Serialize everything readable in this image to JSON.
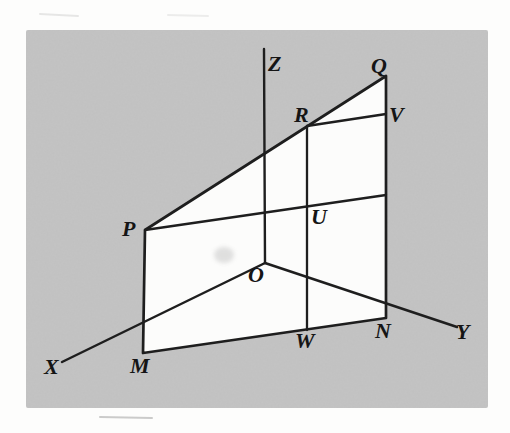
{
  "figure": {
    "colors": {
      "page_background": "#fdfdfc",
      "panel_gray": "#c4c4c4",
      "plane_white": "#fcfcfb",
      "line": "#1e1e1e",
      "label": "#151515",
      "artifact_gray": "#8f8f8f"
    },
    "panel": {
      "x": 26,
      "y": 30,
      "width": 462,
      "height": 378
    },
    "points": {
      "O": [
        265,
        263
      ],
      "P": [
        145,
        230
      ],
      "Q": [
        386,
        76
      ],
      "R": [
        307,
        126
      ],
      "V": [
        386,
        114
      ],
      "U": [
        307,
        206
      ],
      "W": [
        307,
        330
      ],
      "M": [
        143,
        353
      ],
      "N": [
        386,
        318
      ]
    },
    "plane_polygon": [
      [
        145,
        230
      ],
      [
        386,
        76
      ],
      [
        386,
        318
      ],
      [
        143,
        353
      ]
    ],
    "plane_stroke_width": 2.7,
    "segments": [
      {
        "name": "axis-z-line",
        "x1": 264,
        "y1": 49,
        "x2": 265,
        "y2": 263,
        "w": 2.4
      },
      {
        "name": "axis-x-line",
        "x1": 265,
        "y1": 263,
        "x2": 62,
        "y2": 362,
        "w": 2.5
      },
      {
        "name": "axis-y-line",
        "x1": 265,
        "y1": 263,
        "x2": 457,
        "y2": 327,
        "w": 2.5
      },
      {
        "name": "segment-r-w",
        "x1": 307,
        "y1": 126,
        "x2": 307,
        "y2": 330,
        "w": 2.3
      },
      {
        "name": "segment-r-v",
        "x1": 307,
        "y1": 126,
        "x2": 386,
        "y2": 114,
        "w": 2.3
      },
      {
        "name": "segment-p-u",
        "x1": 145,
        "y1": 230,
        "x2": 386,
        "y2": 195,
        "w": 2.3
      }
    ],
    "labels": [
      {
        "text": "Z",
        "x": 268,
        "y": 71
      },
      {
        "text": "Q",
        "x": 371,
        "y": 73
      },
      {
        "text": "R",
        "x": 294,
        "y": 122
      },
      {
        "text": "V",
        "x": 389,
        "y": 122
      },
      {
        "text": "P",
        "x": 122,
        "y": 236
      },
      {
        "text": "U",
        "x": 311,
        "y": 224
      },
      {
        "text": "O",
        "x": 248,
        "y": 282
      },
      {
        "text": "X",
        "x": 44,
        "y": 374
      },
      {
        "text": "M",
        "x": 130,
        "y": 373
      },
      {
        "text": "W",
        "x": 295,
        "y": 348
      },
      {
        "text": "N",
        "x": 375,
        "y": 338
      },
      {
        "text": "Y",
        "x": 456,
        "y": 339
      }
    ],
    "artifacts": {
      "smudge": {
        "cx": 224,
        "cy": 255,
        "rx": 10,
        "ry": 8,
        "color": "#b5b5b5",
        "opacity": 0.4
      },
      "dashes": [
        {
          "x1": 100,
          "y1": 417,
          "x2": 152,
          "y2": 418,
          "opacity": 0.45
        },
        {
          "x1": 40,
          "y1": 14,
          "x2": 78,
          "y2": 16,
          "opacity": 0.2
        },
        {
          "x1": 168,
          "y1": 15,
          "x2": 208,
          "y2": 16,
          "opacity": 0.15
        }
      ]
    }
  }
}
